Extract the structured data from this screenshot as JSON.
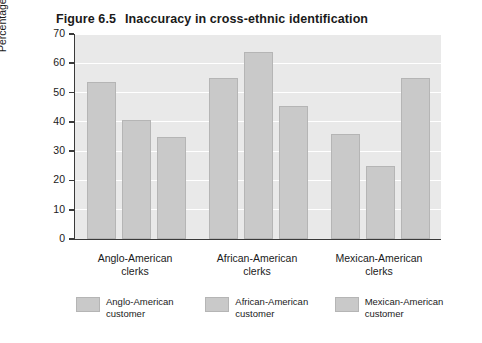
{
  "figure": {
    "number_label": "Figure 6.5",
    "title": "Inaccuracy in cross-ethnic identification"
  },
  "chart_data": {
    "type": "bar",
    "title": "Inaccuracy in cross-ethnic identification",
    "xlabel": "",
    "ylabel": "Percentage of correct identification",
    "ylim": [
      0,
      70
    ],
    "yticks": [
      0,
      10,
      20,
      30,
      40,
      50,
      60,
      70
    ],
    "ytick_labels": [
      "0",
      "10",
      "20",
      "30",
      "40",
      "50",
      "60",
      "70"
    ],
    "grid": true,
    "legend_position": "bottom",
    "categories": [
      "Anglo-American clerks",
      "African-American clerks",
      "Mexican-American clerks"
    ],
    "category_lines": [
      [
        "Anglo-American",
        "clerks"
      ],
      [
        "African-American",
        "clerks"
      ],
      [
        "Mexican-American",
        "clerks"
      ]
    ],
    "series": [
      {
        "name": "Anglo-American customer",
        "name_lines": [
          "Anglo-American",
          "customer"
        ],
        "color": "#c9c9c9",
        "values": [
          53.5,
          55,
          36
        ]
      },
      {
        "name": "African-American customer",
        "name_lines": [
          "African-American",
          "customer"
        ],
        "color": "#c9c9c9",
        "values": [
          40.5,
          64,
          25
        ]
      },
      {
        "name": "Mexican-American customer",
        "name_lines": [
          "Mexican-American",
          "customer"
        ],
        "color": "#c9c9c9",
        "values": [
          35,
          45.5,
          55
        ]
      }
    ]
  }
}
